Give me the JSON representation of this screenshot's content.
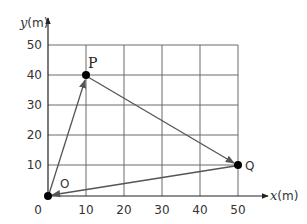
{
  "diagram": {
    "type": "position-displacement-grid",
    "x_axis": {
      "var": "x",
      "unit": "(m)",
      "ticks": [
        "10",
        "20",
        "30",
        "40",
        "50"
      ]
    },
    "y_axis": {
      "var": "y",
      "unit": "(m)",
      "ticks": [
        "10",
        "20",
        "30",
        "40",
        "50"
      ]
    },
    "origin_label": "0",
    "points": [
      {
        "label": "O",
        "x": 0,
        "y": 0
      },
      {
        "label": "P",
        "x": 10,
        "y": 40
      },
      {
        "label": "Q",
        "x": 50,
        "y": 10
      }
    ],
    "arrows": [
      {
        "from": "O",
        "to": "P"
      },
      {
        "from": "P",
        "to": "Q"
      },
      {
        "from": "Q",
        "to": "O"
      }
    ],
    "colors": {
      "grid": "#555555",
      "arrow": "#555555",
      "point": "#000000",
      "text": "#333333"
    }
  }
}
